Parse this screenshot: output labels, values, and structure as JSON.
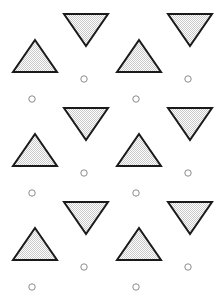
{
  "canvas": {
    "width": 214,
    "height": 303,
    "background_color": "#ffffff",
    "title": "tiled-triangle-circle-pattern"
  },
  "style": {
    "triangle_stroke_color": "#1a1a1a",
    "triangle_stroke_width": 2,
    "triangle_fill_color": "#c9c9c9",
    "triangle_fill_pattern": "checker-hatch",
    "circle_stroke_color": "#8c8c8c",
    "circle_stroke_width": 1,
    "circle_fill_color": "none",
    "circle_radius": 3.2
  },
  "lattice": {
    "cell_width": 104,
    "cell_height": 94,
    "columns": 2,
    "rows": 4,
    "origin_x": 13,
    "origin_y": -48
  },
  "motif": {
    "up_triangle": {
      "label": "up-triangle",
      "offset_x": 0,
      "offset_y": 88,
      "base_width": 44,
      "height": 32,
      "orientation": "up"
    },
    "down_triangle": {
      "label": "down-triangle",
      "offset_x": 51,
      "offset_y": 62,
      "base_width": 44,
      "height": 32,
      "orientation": "down"
    },
    "circle_a": {
      "label": "circle-upper",
      "offset_x": 71,
      "offset_y": 127
    },
    "circle_b": {
      "label": "circle-lower",
      "offset_x": 19,
      "offset_y": 147
    }
  },
  "shapes": {
    "up_triangles": [
      {
        "cx": 35,
        "cy": 56,
        "w": 44,
        "h": 32
      },
      {
        "cx": 139,
        "cy": 56,
        "w": 44,
        "h": 32
      },
      {
        "cx": 35,
        "cy": 150,
        "w": 44,
        "h": 32
      },
      {
        "cx": 139,
        "cy": 150,
        "w": 44,
        "h": 32
      },
      {
        "cx": 35,
        "cy": 244,
        "w": 44,
        "h": 32
      },
      {
        "cx": 139,
        "cy": 244,
        "w": 44,
        "h": 32
      }
    ],
    "down_triangles": [
      {
        "cx": 86,
        "cy": 30,
        "w": 44,
        "h": 32
      },
      {
        "cx": 190,
        "cy": 30,
        "w": 44,
        "h": 32
      },
      {
        "cx": 86,
        "cy": 124,
        "w": 44,
        "h": 32
      },
      {
        "cx": 190,
        "cy": 124,
        "w": 44,
        "h": 32
      },
      {
        "cx": 86,
        "cy": 218,
        "w": 44,
        "h": 32
      },
      {
        "cx": 190,
        "cy": 218,
        "w": 44,
        "h": 32
      }
    ],
    "circles": [
      {
        "cx": 84,
        "cy": 79,
        "r": 3.2
      },
      {
        "cx": 188,
        "cy": 79,
        "r": 3.2
      },
      {
        "cx": 32,
        "cy": 99,
        "r": 3.2
      },
      {
        "cx": 136,
        "cy": 99,
        "r": 3.2
      },
      {
        "cx": 84,
        "cy": 173,
        "r": 3.2
      },
      {
        "cx": 188,
        "cy": 173,
        "r": 3.2
      },
      {
        "cx": 32,
        "cy": 193,
        "r": 3.2
      },
      {
        "cx": 136,
        "cy": 193,
        "r": 3.2
      },
      {
        "cx": 84,
        "cy": 267,
        "r": 3.2
      },
      {
        "cx": 188,
        "cy": 267,
        "r": 3.2
      },
      {
        "cx": 32,
        "cy": 287,
        "r": 3.2
      },
      {
        "cx": 136,
        "cy": 287,
        "r": 3.2
      }
    ]
  }
}
